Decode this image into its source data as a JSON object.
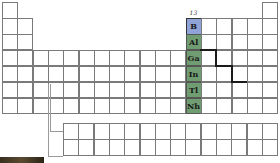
{
  "group_label": "13",
  "highlight_colors": {
    "boron": "#8fa3d6",
    "group": "#6f9c70",
    "metalloid_line": "#1a1a1a"
  },
  "grid": {
    "columns": 18,
    "main_rows": 7,
    "f_block_rows": 2,
    "f_block_columns": 14
  },
  "group13_elements": [
    {
      "symbol": "B",
      "period": 2,
      "color": "blue"
    },
    {
      "symbol": "Al",
      "period": 3,
      "color": "green"
    },
    {
      "symbol": "Ga",
      "period": 4,
      "color": "green"
    },
    {
      "symbol": "In",
      "period": 5,
      "color": "green"
    },
    {
      "symbol": "Tl",
      "period": 6,
      "color": "green"
    },
    {
      "symbol": "Nh",
      "period": 7,
      "color": "green"
    }
  ]
}
